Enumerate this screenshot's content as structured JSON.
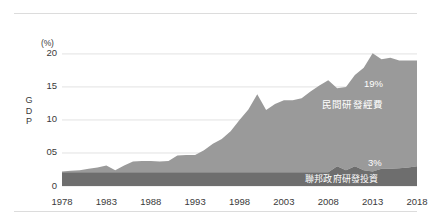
{
  "chart_data": {
    "type": "area",
    "stacked": true,
    "title": "",
    "subtitle": "",
    "xlabel": "年",
    "ylabel": "GDP",
    "yunit": "(%)",
    "ylim": [
      0,
      21.5
    ],
    "xlim": [
      1978,
      2018
    ],
    "grid": true,
    "grid_axis": "y",
    "legend_position": "inline-annotation",
    "ytick_labels": [
      "0",
      "05",
      "10",
      "15",
      "20"
    ],
    "ytick_values": [
      0,
      5,
      10,
      15,
      20
    ],
    "xtick_labels": [
      "1978",
      "1983",
      "1988",
      "1993",
      "1998",
      "2003",
      "2008",
      "2013",
      "2018"
    ],
    "xtick_values": [
      1978,
      1983,
      1988,
      1993,
      1998,
      2003,
      2008,
      2013,
      2018
    ],
    "colors": {
      "private": "#9a9a9a",
      "federal": "#6e6e6e",
      "grid": "#e2e2e2",
      "rule": "#dcdcdc",
      "text": "#3a3a3a",
      "annotation_text": "#ffffff",
      "background": "#ffffff"
    },
    "annotations": [
      {
        "text": "19%",
        "series": "private",
        "value": 19
      },
      {
        "text": "民間研發經費",
        "series": "private"
      },
      {
        "text": "3%",
        "series": "federal",
        "value": 3
      },
      {
        "text": "聯邦政府研發投資",
        "series": "federal"
      }
    ],
    "x": [
      1978,
      1979,
      1980,
      1981,
      1982,
      1983,
      1984,
      1985,
      1986,
      1987,
      1988,
      1989,
      1990,
      1991,
      1992,
      1993,
      1994,
      1995,
      1996,
      1997,
      1998,
      1999,
      2000,
      2001,
      2002,
      2003,
      2004,
      2005,
      2006,
      2007,
      2008,
      2009,
      2010,
      2011,
      2012,
      2013,
      2014,
      2015,
      2016,
      2017,
      2018
    ],
    "series": [
      {
        "name": "聯邦政府研發投資",
        "key": "federal",
        "color": "#6e6e6e",
        "label": "3%",
        "values": [
          2.1,
          2.1,
          2.1,
          2.1,
          2.1,
          2.1,
          2.1,
          2.1,
          2.1,
          2.1,
          2.1,
          2.1,
          2.1,
          2.1,
          2.1,
          2.1,
          2.1,
          2.1,
          2.1,
          2.1,
          2.1,
          2.1,
          2.1,
          2.1,
          2.1,
          2.1,
          2.1,
          2.1,
          2.1,
          2.1,
          2.1,
          3.0,
          2.4,
          3.0,
          2.4,
          2.2,
          2.6,
          2.6,
          2.7,
          2.8,
          3.0
        ]
      },
      {
        "name": "民間研發經費",
        "key": "private",
        "color": "#9a9a9a",
        "label": "19%",
        "values": [
          0.1,
          0.2,
          0.3,
          0.5,
          0.7,
          1.0,
          0.3,
          1.0,
          1.6,
          1.7,
          1.7,
          1.6,
          1.7,
          2.5,
          2.6,
          2.6,
          3.3,
          4.3,
          5.0,
          6.2,
          7.9,
          9.5,
          11.8,
          9.4,
          10.3,
          10.9,
          10.9,
          11.2,
          12.2,
          13.1,
          13.9,
          11.8,
          12.6,
          13.8,
          15.5,
          17.9,
          16.6,
          16.8,
          16.3,
          16.2,
          16.0
        ]
      }
    ]
  },
  "axis": {
    "y_unit_label": "(%)",
    "y_axis_title_chars": [
      "G",
      "D",
      "P"
    ],
    "x_unit_label": "(年)"
  }
}
